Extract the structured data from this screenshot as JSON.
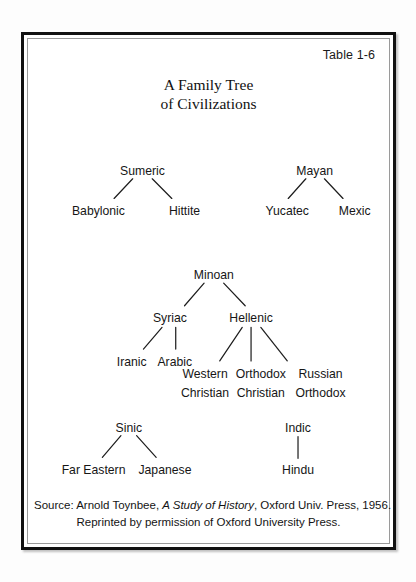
{
  "figure": {
    "table_number": "Table 1-6",
    "title_line1": "A Family Tree",
    "title_line2": "of Civilizations"
  },
  "source": {
    "line1_prefix": "Source: Arnold Toynbee, ",
    "line1_work": "A Study of History",
    "line1_suffix": ", Oxford Univ. Press,  1956.",
    "line2": "Reprinted by permission of Oxford University Press."
  },
  "tree": {
    "nodes": {
      "sumeric": "Sumeric",
      "babylonic": "Babylonic",
      "hittite": "Hittite",
      "mayan": "Mayan",
      "yucatec": "Yucatec",
      "mexic": "Mexic",
      "minoan": "Minoan",
      "syriac": "Syriac",
      "hellenic": "Hellenic",
      "iranic": "Iranic",
      "arabic": "Arabic",
      "western_christian_l1": "Western",
      "western_christian_l2": "Christian",
      "orthodox_christian_l1": "Orthodox",
      "orthodox_christian_l2": "Christian",
      "russian_orthodox_l1": "Russian",
      "russian_orthodox_l2": "Orthodox",
      "sinic": "Sinic",
      "far_eastern": "Far Eastern",
      "japanese": "Japanese",
      "indic": "Indic",
      "hindu": "Hindu"
    },
    "edges": [
      {
        "from": "sumeric",
        "to": "babylonic"
      },
      {
        "from": "sumeric",
        "to": "hittite"
      },
      {
        "from": "mayan",
        "to": "yucatec"
      },
      {
        "from": "mayan",
        "to": "mexic"
      },
      {
        "from": "minoan",
        "to": "syriac"
      },
      {
        "from": "minoan",
        "to": "hellenic"
      },
      {
        "from": "syriac",
        "to": "iranic"
      },
      {
        "from": "syriac",
        "to": "arabic"
      },
      {
        "from": "hellenic",
        "to": "western_christian"
      },
      {
        "from": "hellenic",
        "to": "orthodox_christian"
      },
      {
        "from": "hellenic",
        "to": "russian_orthodox"
      },
      {
        "from": "sinic",
        "to": "far_eastern"
      },
      {
        "from": "sinic",
        "to": "japanese"
      },
      {
        "from": "indic",
        "to": "hindu"
      }
    ]
  },
  "colors": {
    "ink": "#161616",
    "frame": "#111111",
    "inner_frame": "#9a9a9a",
    "paper": "#ffffff"
  }
}
